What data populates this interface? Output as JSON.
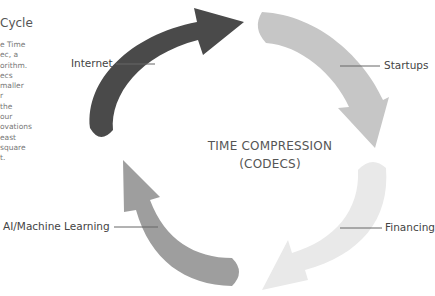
{
  "sidebar": {
    "title": "Cycle",
    "body_lines": [
      "e Time",
      "ec, a",
      "orithm.",
      "ecs",
      "maller",
      "r",
      "the",
      "our",
      "ovations",
      "east",
      "square",
      "t."
    ]
  },
  "diagram": {
    "center_title_line1": "TIME COMPRESSION",
    "center_title_line2": "(CODECS)",
    "steps": [
      {
        "label": "Internet",
        "color": "#4a4a4a"
      },
      {
        "label": "Startups",
        "color": "#c6c6c6"
      },
      {
        "label": "Financing",
        "color": "#e9e9e9"
      },
      {
        "label": "AI/Machine Learning",
        "color": "#9e9e9e"
      }
    ],
    "leader_color": "#666666"
  }
}
